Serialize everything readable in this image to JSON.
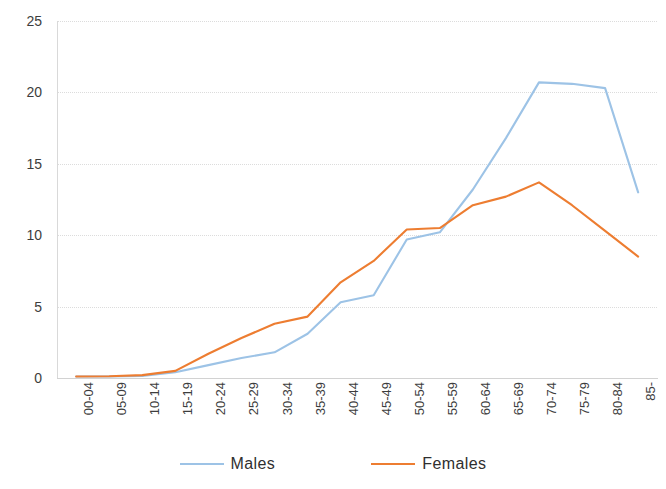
{
  "chart_data": {
    "type": "line",
    "title": "",
    "xlabel": "",
    "ylabel": "",
    "ylim": [
      0,
      25
    ],
    "yticks": [
      0,
      5,
      10,
      15,
      20,
      25
    ],
    "grid": true,
    "legend_position": "bottom",
    "categories": [
      "00-04",
      "05-09",
      "10-14",
      "15-19",
      "20-24",
      "25-29",
      "30-34",
      "35-39",
      "40-44",
      "45-49",
      "50-54",
      "55-59",
      "60-64",
      "65-69",
      "70-74",
      "75-79",
      "80-84",
      "85-"
    ],
    "series": [
      {
        "name": "Males",
        "color": "#9DC3E6",
        "values": [
          0.1,
          0.1,
          0.15,
          0.4,
          0.9,
          1.4,
          1.8,
          3.1,
          5.3,
          5.8,
          9.7,
          10.2,
          13.2,
          16.8,
          20.7,
          20.6,
          20.3,
          13.0
        ]
      },
      {
        "name": "Females",
        "color": "#ED7D31",
        "values": [
          0.1,
          0.12,
          0.2,
          0.5,
          1.7,
          2.8,
          3.8,
          4.3,
          6.7,
          8.2,
          10.4,
          10.5,
          12.1,
          12.7,
          13.7,
          12.1,
          10.3,
          8.5
        ]
      }
    ]
  },
  "axes": {
    "y_tick_labels": [
      "0",
      "5",
      "10",
      "15",
      "20",
      "25"
    ]
  },
  "legend": {
    "items": [
      {
        "label": "Males",
        "color": "#9DC3E6"
      },
      {
        "label": "Females",
        "color": "#ED7D31"
      }
    ]
  }
}
